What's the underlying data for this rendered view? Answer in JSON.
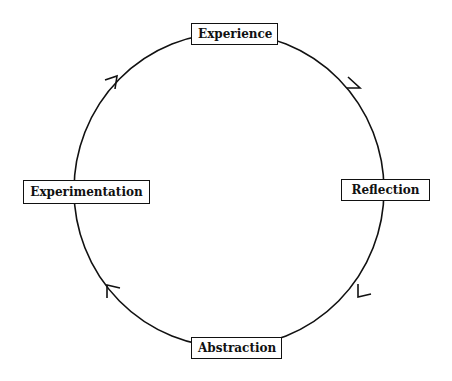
{
  "diagram": {
    "type": "cycle",
    "direction": "clockwise",
    "nodes": [
      {
        "id": "top",
        "label": "Experience"
      },
      {
        "id": "right",
        "label": "Reflection"
      },
      {
        "id": "bottom",
        "label": "Abstraction"
      },
      {
        "id": "left",
        "label": "Experimentation"
      }
    ],
    "edges": [
      {
        "from": "Experience",
        "to": "Reflection"
      },
      {
        "from": "Reflection",
        "to": "Abstraction"
      },
      {
        "from": "Abstraction",
        "to": "Experimentation"
      },
      {
        "from": "Experimentation",
        "to": "Experience"
      }
    ],
    "colors": {
      "stroke": "#111111",
      "background": "#ffffff"
    }
  }
}
